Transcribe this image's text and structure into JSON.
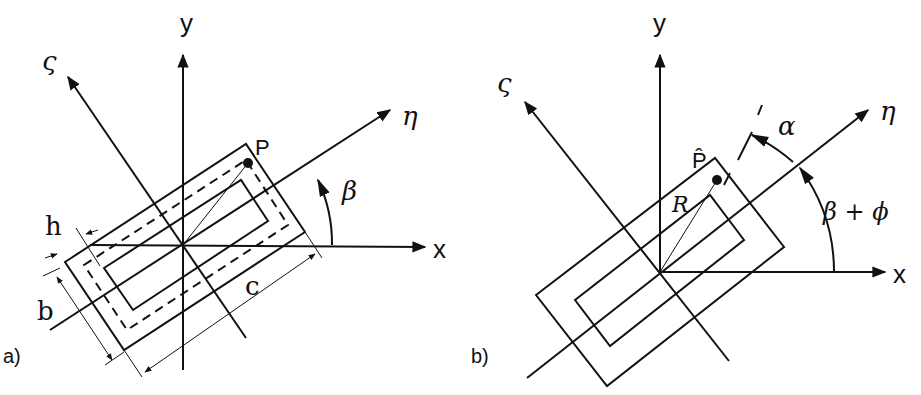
{
  "figure": {
    "panel_a": {
      "label": "a)",
      "axes": {
        "x": "x",
        "y": "y",
        "eta": "η",
        "zeta": "ς"
      },
      "point": "P",
      "angle": "β",
      "dimensions": {
        "h": "h",
        "b": "b",
        "c": "c"
      }
    },
    "panel_b": {
      "label": "b)",
      "axes": {
        "x": "x",
        "y": "y",
        "eta": "η",
        "zeta": "ς"
      },
      "point": "P̂",
      "radius": "R",
      "angle_alpha": "α",
      "angle_beta_phi": "β + ϕ"
    }
  }
}
